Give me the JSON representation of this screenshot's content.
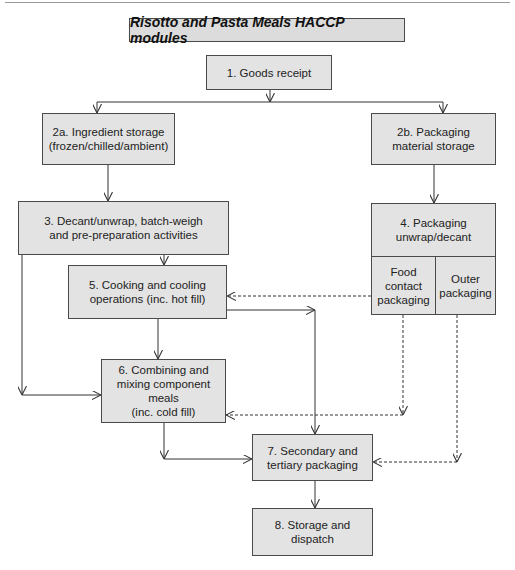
{
  "diagram": {
    "title": "Risotto and Pasta Meals HACCP modules",
    "nodes": {
      "n1": "1. Goods receipt",
      "n2a": "2a. Ingredient storage\n(frozen/chilled/ambient)",
      "n2b": "2b. Packaging\nmaterial storage",
      "n3": "3. Decant/unwrap, batch-weigh\nand pre-preparation activities",
      "n4": "4. Packaging\nunwrap/decant",
      "n4_food": "Food\ncontact\npackaging",
      "n4_outer": "Outer\npackaging",
      "n5": "5. Cooking and cooling\noperations (inc. hot fill)",
      "n6": "6. Combining and\nmixing component\nmeals\n(inc. cold fill)",
      "n7": "7. Secondary and\ntertiary packaging",
      "n8": "8. Storage and\ndispatch"
    },
    "edges": [
      {
        "from": "1. Goods receipt",
        "to": "2a. Ingredient storage",
        "style": "solid"
      },
      {
        "from": "1. Goods receipt",
        "to": "2b. Packaging material storage",
        "style": "solid"
      },
      {
        "from": "2a. Ingredient storage",
        "to": "3. Decant/unwrap",
        "style": "solid"
      },
      {
        "from": "2b. Packaging material storage",
        "to": "4. Packaging unwrap/decant",
        "style": "solid"
      },
      {
        "from": "3. Decant/unwrap",
        "to": "5. Cooking and cooling",
        "style": "solid"
      },
      {
        "from": "3. Decant/unwrap",
        "to": "6. Combining and mixing",
        "style": "solid"
      },
      {
        "from": "5. Cooking and cooling",
        "to": "6. Combining and mixing",
        "style": "solid"
      },
      {
        "from": "5. Cooking and cooling",
        "to": "7. Secondary and tertiary packaging",
        "style": "solid"
      },
      {
        "from": "6. Combining and mixing",
        "to": "7. Secondary and tertiary packaging",
        "style": "solid"
      },
      {
        "from": "7. Secondary and tertiary packaging",
        "to": "8. Storage and dispatch",
        "style": "solid"
      },
      {
        "from": "Food contact packaging",
        "to": "5. Cooking and cooling",
        "style": "dashed"
      },
      {
        "from": "Food contact packaging",
        "to": "6. Combining and mixing",
        "style": "dashed"
      },
      {
        "from": "Outer packaging",
        "to": "7. Secondary and tertiary packaging",
        "style": "dashed"
      }
    ],
    "colors": {
      "box_fill": "#e3e3e3",
      "border": "#4a4a4a",
      "line": "#333333"
    }
  }
}
